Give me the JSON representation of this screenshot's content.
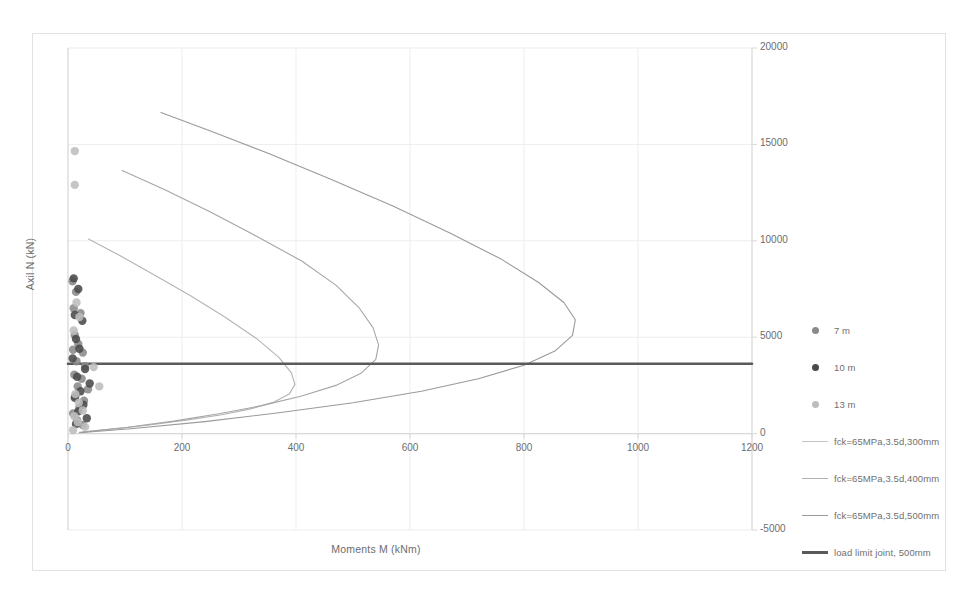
{
  "chart_data": {
    "type": "scatter",
    "title": "",
    "xlabel": "Moments M (kNm)",
    "ylabel": "Axil N (kN)",
    "xlim": [
      0,
      1200
    ],
    "ylim": [
      -5000,
      20000
    ],
    "xticks": [
      "0",
      "200",
      "400",
      "600",
      "800",
      "1000",
      "1200"
    ],
    "yticks": [
      "20000",
      "15000",
      "10000",
      "5000",
      "0",
      "-5000"
    ],
    "grid": true,
    "legend_position": "right",
    "series": [
      {
        "name": "7 m",
        "type": "scatter",
        "color": "#8a8a8a",
        "points": [
          [
            8,
            7900
          ],
          [
            14,
            7350
          ],
          [
            10,
            6500
          ],
          [
            22,
            6250
          ],
          [
            12,
            5100
          ],
          [
            18,
            4650
          ],
          [
            9,
            4350
          ],
          [
            26,
            4200
          ],
          [
            15,
            3750
          ],
          [
            30,
            3500
          ],
          [
            11,
            3050
          ],
          [
            24,
            2850
          ],
          [
            17,
            2450
          ],
          [
            35,
            2300
          ],
          [
            13,
            1950
          ],
          [
            28,
            1700
          ],
          [
            20,
            1350
          ],
          [
            9,
            1050
          ],
          [
            16,
            700
          ],
          [
            25,
            450
          ]
        ]
      },
      {
        "name": "10 m",
        "type": "scatter",
        "color": "#4a4a4a",
        "points": [
          [
            10,
            8050
          ],
          [
            18,
            7500
          ],
          [
            12,
            6150
          ],
          [
            25,
            5850
          ],
          [
            14,
            4900
          ],
          [
            20,
            4400
          ],
          [
            8,
            3900
          ],
          [
            30,
            3350
          ],
          [
            16,
            2950
          ],
          [
            38,
            2600
          ],
          [
            22,
            2200
          ],
          [
            12,
            1850
          ],
          [
            27,
            1500
          ],
          [
            18,
            1150
          ],
          [
            33,
            800
          ],
          [
            14,
            500
          ]
        ]
      },
      {
        "name": "13 m",
        "type": "scatter",
        "color": "#bdbdbd",
        "points": [
          [
            12,
            14650
          ],
          [
            12,
            12900
          ],
          [
            15,
            6800
          ],
          [
            20,
            6050
          ],
          [
            10,
            5350
          ],
          [
            45,
            3450
          ],
          [
            55,
            2450
          ],
          [
            13,
            2050
          ],
          [
            19,
            1600
          ],
          [
            26,
            1200
          ],
          [
            11,
            900
          ],
          [
            17,
            600
          ],
          [
            30,
            350
          ],
          [
            9,
            180
          ]
        ]
      },
      {
        "name": "fck=65MPa,3.5d,300mm",
        "type": "line",
        "color": "#b4b4b4",
        "points": [
          [
            36,
            10100
          ],
          [
            90,
            9250
          ],
          [
            150,
            8250
          ],
          [
            215,
            7150
          ],
          [
            275,
            6050
          ],
          [
            330,
            4950
          ],
          [
            370,
            3950
          ],
          [
            392,
            3150
          ],
          [
            398,
            2550
          ],
          [
            388,
            2050
          ],
          [
            360,
            1620
          ],
          [
            320,
            1280
          ],
          [
            270,
            980
          ],
          [
            210,
            710
          ],
          [
            150,
            470
          ],
          [
            90,
            270
          ],
          [
            20,
            60
          ]
        ]
      },
      {
        "name": "fck=65MPa,3.5d,400mm",
        "type": "line",
        "color": "#a6a6a6",
        "points": [
          [
            95,
            13650
          ],
          [
            170,
            12650
          ],
          [
            250,
            11500
          ],
          [
            330,
            10250
          ],
          [
            410,
            8950
          ],
          [
            470,
            7700
          ],
          [
            510,
            6550
          ],
          [
            535,
            5500
          ],
          [
            545,
            4600
          ],
          [
            540,
            3850
          ],
          [
            515,
            3150
          ],
          [
            470,
            2500
          ],
          [
            410,
            1950
          ],
          [
            340,
            1450
          ],
          [
            265,
            1030
          ],
          [
            185,
            650
          ],
          [
            105,
            330
          ],
          [
            25,
            80
          ]
        ]
      },
      {
        "name": "fck=65MPa,3.5d,500mm",
        "type": "line",
        "color": "#9a9a9a",
        "points": [
          [
            163,
            16650
          ],
          [
            250,
            15700
          ],
          [
            350,
            14550
          ],
          [
            460,
            13200
          ],
          [
            570,
            11800
          ],
          [
            670,
            10400
          ],
          [
            760,
            9050
          ],
          [
            825,
            7850
          ],
          [
            870,
            6800
          ],
          [
            890,
            5900
          ],
          [
            885,
            5100
          ],
          [
            855,
            4300
          ],
          [
            800,
            3550
          ],
          [
            720,
            2850
          ],
          [
            620,
            2200
          ],
          [
            500,
            1600
          ],
          [
            370,
            1080
          ],
          [
            240,
            620
          ],
          [
            110,
            250
          ],
          [
            20,
            40
          ]
        ]
      },
      {
        "name": "load limit joint, 500mm",
        "type": "line",
        "color": "#5a5a5a",
        "points": [
          [
            0,
            3620
          ],
          [
            1200,
            3620
          ]
        ]
      }
    ]
  },
  "legend": {
    "items": [
      {
        "label": "7 m",
        "marker": "dot",
        "color": "#8a8a8a"
      },
      {
        "label": "10 m",
        "marker": "dot",
        "color": "#4a4a4a"
      },
      {
        "label": "13 m",
        "marker": "dot",
        "color": "#bdbdbd"
      },
      {
        "label": "fck=65MPa,3.5d,300mm",
        "marker": "line",
        "color": "#c4c4c4"
      },
      {
        "label": "fck=65MPa,3.5d,400mm",
        "marker": "line",
        "color": "#b0b0b0"
      },
      {
        "label": "fck=65MPa,3.5d,500mm",
        "marker": "line",
        "color": "#9a9a9a"
      },
      {
        "label": "load limit joint, 500mm",
        "marker": "line-thick",
        "color": "#5a5a5a"
      }
    ]
  },
  "colors": {
    "grid": "#ededed",
    "axis": "#d8d8d8",
    "frame": "#e2e2e2",
    "text": "#6d6d6d"
  }
}
